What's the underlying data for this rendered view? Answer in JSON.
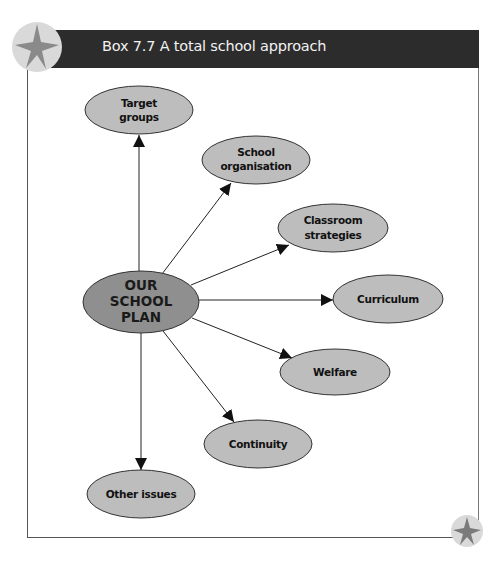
{
  "box": {
    "title": "Box 7.7 A total school approach",
    "header_color": "#2c2c2c",
    "corner_icon": "star-icon"
  },
  "colors": {
    "center_node_fill": "#8f8f8f",
    "node_fill": "#bdbdbd",
    "node_stroke": "#333333",
    "edge_color": "#222222",
    "star_badge_fill": "#d9d9d9",
    "star_fill": "#8a8a8a"
  },
  "diagram": {
    "center": {
      "id": "our-school-plan",
      "lines": [
        "OUR",
        "SCHOOL",
        "PLAN"
      ]
    },
    "nodes": [
      {
        "id": "target-groups",
        "lines": [
          "Target",
          "groups"
        ]
      },
      {
        "id": "school-organisation",
        "lines": [
          "School",
          "organisation"
        ]
      },
      {
        "id": "classroom-strategies",
        "lines": [
          "Classroom",
          "strategies"
        ]
      },
      {
        "id": "curriculum",
        "lines": [
          "Curriculum"
        ]
      },
      {
        "id": "welfare",
        "lines": [
          "Welfare"
        ]
      },
      {
        "id": "continuity",
        "lines": [
          "Continuity"
        ]
      },
      {
        "id": "other-issues",
        "lines": [
          "Other issues"
        ]
      }
    ],
    "edges": [
      {
        "from": "our-school-plan",
        "to": "target-groups"
      },
      {
        "from": "our-school-plan",
        "to": "school-organisation"
      },
      {
        "from": "our-school-plan",
        "to": "classroom-strategies"
      },
      {
        "from": "our-school-plan",
        "to": "curriculum"
      },
      {
        "from": "our-school-plan",
        "to": "welfare"
      },
      {
        "from": "our-school-plan",
        "to": "continuity"
      },
      {
        "from": "our-school-plan",
        "to": "other-issues"
      }
    ]
  }
}
